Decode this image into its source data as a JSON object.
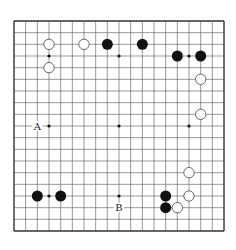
{
  "board": {
    "size": 19,
    "origin": [
      14,
      21
    ],
    "spacing": 11.667,
    "line_color": "#555555",
    "edge_color": "#333333",
    "black_color": "#111111",
    "white_fill": "#ffffff",
    "white_stroke": "#444444",
    "star_points": [
      [
        3,
        3
      ],
      [
        9,
        3
      ],
      [
        15,
        3
      ],
      [
        3,
        9
      ],
      [
        9,
        9
      ],
      [
        15,
        9
      ],
      [
        3,
        15
      ],
      [
        9,
        15
      ],
      [
        15,
        15
      ]
    ],
    "stones": [
      {
        "color": "white",
        "col": 3,
        "row": 2
      },
      {
        "color": "white",
        "col": 6,
        "row": 2
      },
      {
        "color": "black",
        "col": 8,
        "row": 2
      },
      {
        "color": "black",
        "col": 11,
        "row": 2
      },
      {
        "color": "white",
        "col": 3,
        "row": 4
      },
      {
        "color": "black",
        "col": 14,
        "row": 3
      },
      {
        "color": "black",
        "col": 16,
        "row": 3
      },
      {
        "color": "white",
        "col": 16,
        "row": 5
      },
      {
        "color": "white",
        "col": 16,
        "row": 8
      },
      {
        "color": "white",
        "col": 15,
        "row": 13
      },
      {
        "color": "white",
        "col": 15,
        "row": 15
      },
      {
        "color": "black",
        "col": 13,
        "row": 15
      },
      {
        "color": "black",
        "col": 13,
        "row": 16
      },
      {
        "color": "white",
        "col": 14,
        "row": 16
      },
      {
        "color": "black",
        "col": 2,
        "row": 15
      },
      {
        "color": "black",
        "col": 4,
        "row": 15
      }
    ],
    "labels": [
      {
        "text": "A",
        "col": 2,
        "row": 9
      },
      {
        "text": "B",
        "col": 9,
        "row": 16
      }
    ]
  }
}
